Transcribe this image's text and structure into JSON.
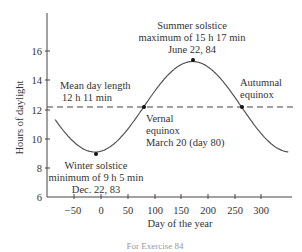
{
  "chart_data": {
    "type": "line",
    "title": "",
    "xlabel": "Day of the year",
    "ylabel": "Hours of daylight",
    "xlim": [
      -90,
      355
    ],
    "ylim": [
      6,
      18
    ],
    "x_ticks": [
      -50,
      0,
      50,
      100,
      150,
      200,
      250,
      300
    ],
    "y_ticks": [
      6,
      8,
      10,
      12,
      14,
      16
    ],
    "grid": false,
    "legend": null,
    "series": [
      {
        "name": "Hours of daylight",
        "style": "solid sinusoid",
        "model": "y = 12.18 + 3.1*sin(2*pi*(x-80)/365)",
        "x": [
          -90,
          -60,
          -30,
          -9,
          0,
          30,
          60,
          80,
          110,
          140,
          172,
          200,
          230,
          264,
          290,
          320,
          350
        ],
        "y": [
          12.1,
          10.6,
          9.4,
          9.08,
          9.13,
          9.9,
          11.1,
          12.18,
          13.73,
          14.95,
          15.28,
          14.9,
          13.87,
          12.18,
          10.9,
          9.6,
          9.1
        ]
      },
      {
        "name": "Mean day length",
        "style": "dashed horizontal",
        "x": [
          -90,
          355
        ],
        "y": [
          12.18,
          12.18
        ]
      }
    ],
    "points": [
      {
        "label": "Winter solstice",
        "x": -9,
        "y": 9.08
      },
      {
        "label": "Vernal equinox",
        "x": 80,
        "y": 12.18
      },
      {
        "label": "Summer solstice",
        "x": 172,
        "y": 15.28
      },
      {
        "label": "Autumnal equinox",
        "x": 264,
        "y": 12.18
      }
    ],
    "annotations": [
      {
        "text": [
          "Summer solstice",
          "maximum of 15 h 17 min",
          "June 22, 84"
        ]
      },
      {
        "text": [
          "Mean day length",
          "12 h 11 min"
        ]
      },
      {
        "text": [
          "Vernal",
          "equinox",
          "March 20 (day 80)"
        ]
      },
      {
        "text": [
          "Autumnal",
          "equinox"
        ]
      },
      {
        "text": [
          "Winter solstice",
          "minimum of 9 h 5 min",
          "Dec. 22, 83"
        ]
      }
    ]
  },
  "labels": {
    "ylabel": "Hours of daylight",
    "xlabel": "Day of the year",
    "summer": [
      "Summer solstice",
      "maximum of 15 h 17 min",
      "June 22, 84"
    ],
    "mean": [
      "Mean day length",
      "12 h 11 min"
    ],
    "vernal": [
      "Vernal",
      "equinox",
      "March 20 (day 80)"
    ],
    "autumnal": [
      "Autumnal",
      "equinox"
    ],
    "winter": [
      "Winter solstice",
      "minimum of 9 h 5 min",
      "Dec. 22, 83"
    ],
    "caption": "For Exercise 84"
  },
  "ticks": {
    "y": [
      "16",
      "14",
      "12",
      "10",
      "8",
      "6"
    ],
    "x": [
      "−50",
      "0",
      "50",
      "100",
      "150",
      "200",
      "250",
      "300"
    ]
  }
}
